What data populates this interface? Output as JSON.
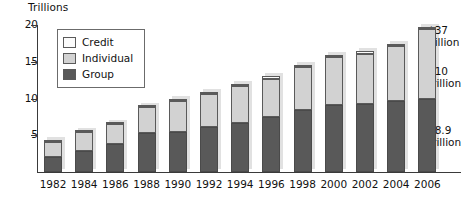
{
  "chart_data": {
    "type": "bar",
    "subtype": "stacked-bar",
    "title": "",
    "ylabel": "Trillions",
    "xlabel": "",
    "ylim": [
      0,
      20
    ],
    "yticks": [
      5,
      10,
      15,
      20
    ],
    "grid": false,
    "legend_position": "top-left-inside",
    "categories": [
      "1982",
      "1984",
      "1986",
      "1988",
      "1990",
      "1992",
      "1994",
      "1996",
      "1998",
      "2000",
      "2002",
      "2004",
      "2006"
    ],
    "series": [
      {
        "name": "Group",
        "color": "#595959",
        "values": [
          2.1,
          2.9,
          3.8,
          5.3,
          5.5,
          6.1,
          6.7,
          7.5,
          8.5,
          9.1,
          9.2,
          9.6,
          10.0
        ]
      },
      {
        "name": "Individual",
        "color": "#d2d2d2",
        "values": [
          2.0,
          2.5,
          2.7,
          3.5,
          4.2,
          4.5,
          5.0,
          5.2,
          5.8,
          6.5,
          6.9,
          7.5,
          9.4
        ]
      },
      {
        "name": "Credit",
        "color": "#fbfbfb",
        "values": [
          0.2,
          0.2,
          0.2,
          0.2,
          0.3,
          0.3,
          0.3,
          0.3,
          0.3,
          0.3,
          0.3,
          0.3,
          0.3
        ]
      }
    ],
    "totals": [
      4.3,
      5.6,
      6.7,
      9.0,
      10.0,
      10.9,
      12.0,
      13.0,
      14.6,
      15.9,
      16.4,
      17.4,
      19.7
    ],
    "annotations": [
      {
        "id": "credit-callout",
        "label": "$37 billion",
        "lines": [
          "$37",
          "billion"
        ],
        "series": "Credit",
        "category": "2006"
      },
      {
        "id": "individual-callout",
        "label": "$10 trillion",
        "lines": [
          "$10",
          "trillion"
        ],
        "series": "Individual",
        "category": "2006"
      },
      {
        "id": "group-callout",
        "label": "$8.9 trillion",
        "lines": [
          "$8.9",
          "trillion"
        ],
        "series": "Group",
        "category": "2006"
      }
    ]
  },
  "axis": {
    "y_title": "Trillions",
    "y_tick_labels": [
      "20",
      "15",
      "10",
      "5"
    ],
    "x_tick_labels": [
      "1982",
      "1984",
      "1986",
      "1988",
      "1990",
      "1992",
      "1994",
      "1996",
      "1998",
      "2000",
      "2002",
      "2004",
      "2006"
    ]
  },
  "legend": {
    "items": [
      {
        "label": "Credit",
        "color": "#fbfbfb"
      },
      {
        "label": "Individual",
        "color": "#d2d2d2"
      },
      {
        "label": "Group",
        "color": "#595959"
      }
    ]
  },
  "callouts": {
    "credit": {
      "line1": "$37",
      "line2": "billion"
    },
    "individual": {
      "line1": "$10",
      "line2": "trillion"
    },
    "group": {
      "line1": "$8.9",
      "line2": "trillion"
    }
  }
}
